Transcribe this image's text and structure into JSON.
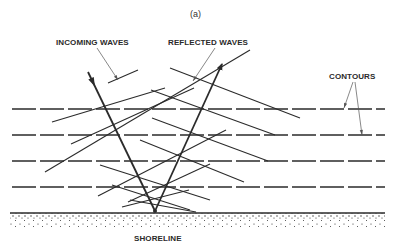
{
  "figure": {
    "caption": "(a)",
    "labels": {
      "incoming": "INCOMING WAVES",
      "reflected": "REFLECTED WAVES",
      "contours": "CONTOURS",
      "shoreline": "SHORELINE"
    },
    "colors": {
      "ink": "#2b2b2b",
      "leader": "#555555",
      "background": "#ffffff"
    },
    "contours": {
      "y": [
        109,
        135,
        161,
        187
      ],
      "x_start": 12,
      "x_end": 385,
      "dash": "24 4"
    },
    "shoreline": {
      "y": 213,
      "x_start": 10,
      "x_end": 385,
      "depth": 15
    },
    "focus": {
      "x": 155,
      "y": 211
    },
    "rays": {
      "incoming": {
        "from": [
          88,
          72
        ],
        "to": [
          155,
          211
        ]
      },
      "reflected": {
        "from": [
          155,
          211
        ],
        "to": [
          222,
          64
        ]
      }
    },
    "incoming_crests": [
      [
        [
          108,
          83
        ],
        [
          138,
          70
        ]
      ],
      [
        [
          52,
          122
        ],
        [
          165,
          88
        ]
      ],
      [
        [
          71,
          144
        ],
        [
          194,
          88
        ]
      ],
      [
        [
          45,
          172
        ],
        [
          250,
          50
        ]
      ],
      [
        [
          98,
          196
        ],
        [
          226,
          130
        ]
      ],
      [
        [
          128,
          202
        ],
        [
          210,
          164
        ]
      ],
      [
        [
          122,
          207
        ],
        [
          189,
          190
        ]
      ]
    ],
    "reflected_crests": [
      [
        [
          170,
          68
        ],
        [
          300,
          118
        ]
      ],
      [
        [
          151,
          90
        ],
        [
          275,
          135
        ]
      ],
      [
        [
          152,
          118
        ],
        [
          268,
          161
        ]
      ],
      [
        [
          140,
          140
        ],
        [
          244,
          182
        ]
      ],
      [
        [
          100,
          165
        ],
        [
          210,
          200
        ]
      ],
      [
        [
          112,
          185
        ],
        [
          190,
          210
        ]
      ],
      [
        [
          130,
          200
        ],
        [
          196,
          212
        ]
      ]
    ],
    "leaders": {
      "incoming": {
        "from": [
          97,
          48
        ],
        "to": [
          118,
          80
        ]
      },
      "reflected": {
        "from": [
          215,
          48
        ],
        "to": [
          193,
          81
        ]
      },
      "contours_a": {
        "from": [
          353,
          82
        ],
        "to": [
          344,
          108
        ]
      },
      "contours_b": {
        "from": [
          355,
          82
        ],
        "to": [
          362,
          135
        ]
      }
    }
  }
}
